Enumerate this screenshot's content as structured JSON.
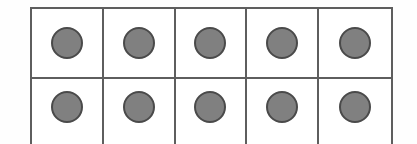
{
  "figure": {
    "kind": "ten-frame",
    "rows": 2,
    "columns": 5,
    "total_cells": 10,
    "filled_count": 10,
    "empty_count": 0,
    "counter_label": "counter",
    "cell_label": "ten frame cell"
  },
  "colors": {
    "background": "#fefefe",
    "frame_fill": "#ffffff",
    "frame_border": "#5e5e5e",
    "counter_fill": "#808080",
    "counter_border": "#4a4a4a"
  },
  "chart_data": {
    "type": "table",
    "xlabel": "",
    "ylabel": "",
    "categories": [
      "col-1",
      "col-2",
      "col-3",
      "col-4",
      "col-5"
    ],
    "rows": [
      {
        "name": "row-1",
        "values": [
          1,
          1,
          1,
          1,
          1
        ]
      },
      {
        "name": "row-2",
        "values": [
          1,
          1,
          1,
          1,
          1
        ]
      }
    ],
    "series": [
      {
        "name": "row-1",
        "values": [
          1,
          1,
          1,
          1,
          1
        ]
      },
      {
        "name": "row-2",
        "values": [
          1,
          1,
          1,
          1,
          1
        ]
      }
    ],
    "cell_states": [
      [
        "filled",
        "filled",
        "filled",
        "filled",
        "filled"
      ],
      [
        "filled",
        "filled",
        "filled",
        "filled",
        "filled"
      ]
    ],
    "counts": {
      "filled": 10,
      "empty": 0,
      "total": 10
    },
    "legend": [],
    "grid": true,
    "annotations": []
  }
}
